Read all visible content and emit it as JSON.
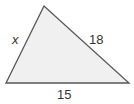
{
  "diagram": {
    "type": "triangle",
    "fill_color": "#f0f0f0",
    "stroke_color": "#555555",
    "vertices": {
      "top": [
        44,
        6
      ],
      "bottom_left": [
        6,
        83
      ],
      "bottom_right": [
        129,
        83
      ]
    },
    "sides": {
      "left": {
        "label": "x"
      },
      "right": {
        "label": "18"
      },
      "bottom": {
        "label": "15"
      }
    }
  }
}
